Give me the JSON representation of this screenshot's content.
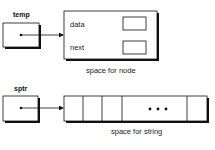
{
  "top": {
    "pointer_label": "temp",
    "fields": [
      "data",
      "next"
    ],
    "caption": "space for node"
  },
  "bottom": {
    "pointer_label": "sptr",
    "ellipsis": "• • •",
    "caption": "space for string"
  }
}
